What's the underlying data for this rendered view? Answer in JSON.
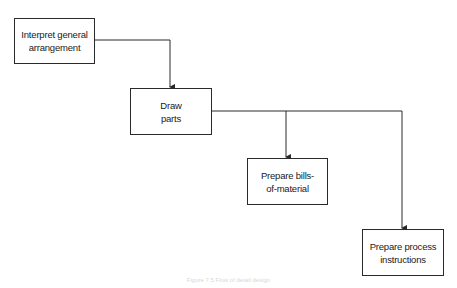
{
  "diagram": {
    "type": "flowchart",
    "nodes": [
      {
        "id": "interpret",
        "label": "Interpret general\narrangement"
      },
      {
        "id": "draw",
        "label": "Draw\nparts"
      },
      {
        "id": "bills",
        "label": "Prepare bills-\nof-material"
      },
      {
        "id": "process",
        "label": "Prepare process\ninstructions"
      }
    ],
    "edges": [
      {
        "from": "interpret",
        "to": "draw"
      },
      {
        "from": "draw",
        "to": "bills"
      },
      {
        "from": "draw",
        "to": "process"
      }
    ],
    "caption": "Figure 7.5 Flow of detail design"
  },
  "colors": {
    "line": "#2a2a2a",
    "background": "#ffffff"
  }
}
